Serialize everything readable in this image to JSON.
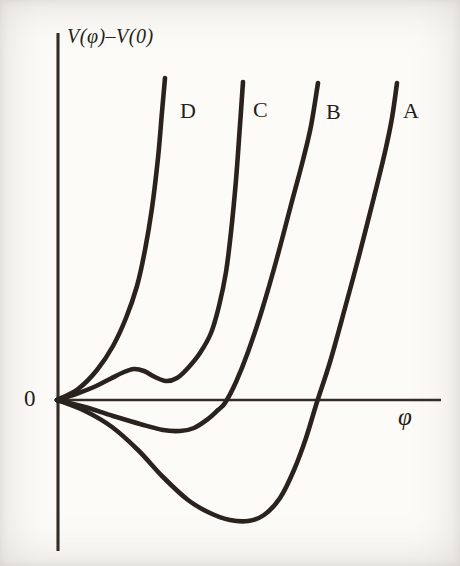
{
  "figure": {
    "ylabel": "V(φ)–V(0)",
    "xlabel": "φ",
    "origin_label": "0"
  },
  "chart_data": {
    "type": "line",
    "xlabel": "φ",
    "ylabel": "V(φ)–V(0)",
    "axes_numeric": false,
    "grid": false,
    "ink_color": "#2a221c",
    "axis_color": "#332b24",
    "stroke_width": 4.6,
    "axes": {
      "x": {
        "x1": 57,
        "y1": 400,
        "x2": 441,
        "y2": 400,
        "width": 2.4
      },
      "y": {
        "x1": 58,
        "y1": 33,
        "x2": 58,
        "y2": 551,
        "width": 3.1
      }
    },
    "curves": [
      {
        "label": "A",
        "label_pos": [
          403,
          100
        ],
        "shape": "deep minimum below zero, crosses axis near x=318px",
        "points": [
          [
            57,
            400
          ],
          [
            85,
            411
          ],
          [
            112,
            427
          ],
          [
            138,
            450
          ],
          [
            163,
            477
          ],
          [
            188,
            500
          ],
          [
            210,
            513
          ],
          [
            230,
            520
          ],
          [
            248,
            521
          ],
          [
            264,
            515
          ],
          [
            280,
            498
          ],
          [
            294,
            470
          ],
          [
            306,
            438
          ],
          [
            317,
            402
          ],
          [
            330,
            362
          ],
          [
            345,
            308
          ],
          [
            360,
            252
          ],
          [
            374,
            197
          ],
          [
            385,
            152
          ],
          [
            392,
            118
          ],
          [
            397,
            83
          ]
        ]
      },
      {
        "label": "B",
        "label_pos": [
          326,
          101
        ],
        "shape": "shallow minimum just below zero, crosses axis near x=227px",
        "points": [
          [
            57,
            400
          ],
          [
            85,
            407
          ],
          [
            113,
            416
          ],
          [
            140,
            424
          ],
          [
            163,
            430
          ],
          [
            180,
            431
          ],
          [
            194,
            428
          ],
          [
            208,
            419
          ],
          [
            218,
            410
          ],
          [
            225,
            403
          ],
          [
            236,
            382
          ],
          [
            248,
            352
          ],
          [
            262,
            310
          ],
          [
            277,
            258
          ],
          [
            291,
            205
          ],
          [
            303,
            160
          ],
          [
            311,
            126
          ],
          [
            318,
            83
          ]
        ]
      },
      {
        "label": "C",
        "label_pos": [
          253,
          99
        ],
        "shape": "small secondary minimum above zero (local max then local min) before steep rise",
        "points": [
          [
            57,
            400
          ],
          [
            76,
            394
          ],
          [
            94,
            387
          ],
          [
            110,
            379
          ],
          [
            124,
            372
          ],
          [
            134,
            369
          ],
          [
            144,
            371
          ],
          [
            155,
            377
          ],
          [
            166,
            381
          ],
          [
            177,
            378
          ],
          [
            188,
            368
          ],
          [
            200,
            353
          ],
          [
            211,
            333
          ],
          [
            219,
            306
          ],
          [
            226,
            272
          ],
          [
            231,
            232
          ],
          [
            236,
            180
          ],
          [
            240,
            125
          ],
          [
            243,
            82
          ]
        ]
      },
      {
        "label": "D",
        "label_pos": [
          180,
          100
        ],
        "shape": "single minimum at origin, monotonic steep rise",
        "points": [
          [
            57,
            400
          ],
          [
            78,
            389
          ],
          [
            97,
            370
          ],
          [
            113,
            346
          ],
          [
            126,
            318
          ],
          [
            137,
            286
          ],
          [
            145,
            250
          ],
          [
            152,
            208
          ],
          [
            158,
            158
          ],
          [
            162,
            112
          ],
          [
            165,
            78
          ]
        ]
      }
    ]
  }
}
